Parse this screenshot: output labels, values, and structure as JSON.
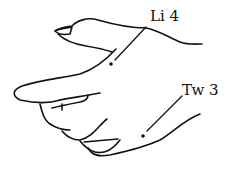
{
  "figure": {
    "stroke_color": "#111111",
    "background": "#ffffff"
  },
  "points": [
    {
      "id": "li4",
      "label": "Li 4",
      "dot": [
        111,
        64
      ],
      "leader_to": [
        146,
        27
      ]
    },
    {
      "id": "tw3",
      "label": "Tw 3",
      "dot": [
        143,
        136
      ],
      "leader_to": [
        182,
        96
      ]
    }
  ]
}
